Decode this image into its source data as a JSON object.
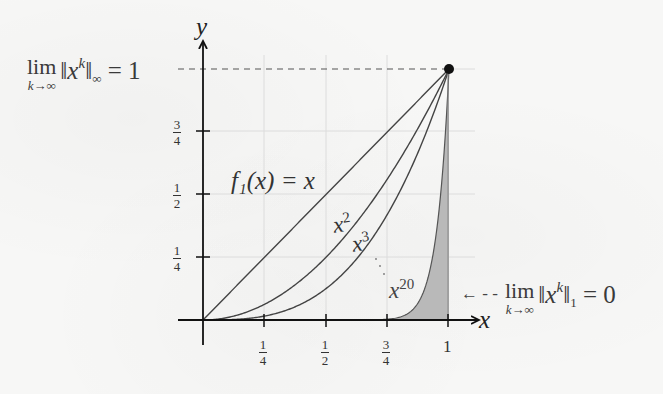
{
  "figure": {
    "axes": {
      "x_label": "x",
      "y_label": "y",
      "x_ticks": [
        "1/4",
        "1/2",
        "3/4",
        "1"
      ],
      "y_ticks": [
        "1/4",
        "1/2",
        "3/4"
      ]
    },
    "curve_labels": {
      "f1": "f₁(x) = x",
      "x2_base": "x",
      "x2_exp": "2",
      "x3_base": "x",
      "x3_exp": "3",
      "x20_base": "x",
      "x20_exp": "20"
    },
    "annotations": {
      "sup_norm": {
        "lim": "lim",
        "sub": "k→∞",
        "pre": "‖x",
        "exp": "k",
        "post": "‖",
        "norm_sub": "∞",
        "rhs": " = 1"
      },
      "l1_norm": {
        "arrow": "← - -",
        "lim": "lim",
        "sub": "k→∞",
        "pre": "‖x",
        "exp": "k",
        "post": "‖",
        "norm_sub": "1",
        "rhs": " = 0"
      }
    },
    "colors": {
      "axis": "#111111",
      "curve": "#444444",
      "grid": "#dcdcdc",
      "shade": "#b8b8b8",
      "text": "#333333"
    }
  },
  "chart_data": {
    "type": "line",
    "title": "",
    "xlabel": "x",
    "ylabel": "y",
    "xlim": [
      0,
      1
    ],
    "ylim": [
      0,
      1
    ],
    "grid": true,
    "x_ticks": [
      0.25,
      0.5,
      0.75,
      1
    ],
    "y_ticks": [
      0.25,
      0.5,
      0.75
    ],
    "series": [
      {
        "name": "f1(x) = x",
        "function": "x^1",
        "x": [
          0,
          0.25,
          0.5,
          0.75,
          1
        ],
        "values": [
          0,
          0.25,
          0.5,
          0.75,
          1
        ]
      },
      {
        "name": "x^2",
        "function": "x^2",
        "x": [
          0,
          0.25,
          0.5,
          0.75,
          1
        ],
        "values": [
          0,
          0.0625,
          0.25,
          0.5625,
          1
        ]
      },
      {
        "name": "x^3",
        "function": "x^3",
        "x": [
          0,
          0.25,
          0.5,
          0.75,
          1
        ],
        "values": [
          0,
          0.0156,
          0.125,
          0.4219,
          1
        ]
      },
      {
        "name": "x^20",
        "function": "x^20",
        "x": [
          0,
          0.25,
          0.5,
          0.75,
          1
        ],
        "values": [
          0,
          0,
          0,
          0.0032,
          1
        ],
        "shaded_area_below": true
      }
    ],
    "points": [
      {
        "x": 1,
        "y": 1,
        "marker": "filled-circle"
      }
    ],
    "annotations": [
      "lim_{k→∞} ||x^k||_∞ = 1 (dashed line at y=1)",
      "lim_{k→∞} ||x^k||_1 = 0 (arrow pointing to shaded area under x^20)"
    ]
  }
}
